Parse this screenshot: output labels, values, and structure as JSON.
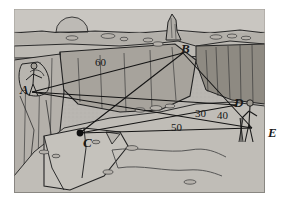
{
  "scene": {
    "kind": "illustration",
    "subject": "canyon-survey-diagram",
    "description": "Line drawing of a rocky canyon / quarry with two human figures and straight survey sight-lines connecting labelled stations",
    "background_color": "#ffffff",
    "terrain_color": "#b9b6b1",
    "terrain_shadow_color": "#9a968f",
    "terrain_dark_color": "#868279",
    "ink_color": "#1a1a1a",
    "frame": {
      "x": 14,
      "y": 9,
      "width": 251,
      "height": 184
    }
  },
  "labels": {
    "points": [
      {
        "id": "A",
        "text": "A",
        "x": 20,
        "y": 83,
        "note": "left rim, standing figure"
      },
      {
        "id": "B",
        "text": "B",
        "x": 181,
        "y": 42,
        "note": "far rim below rock spire"
      },
      {
        "id": "C",
        "text": "C",
        "x": 83,
        "y": 136,
        "note": "foreground ledge, marked with black dot"
      },
      {
        "id": "D",
        "text": "D",
        "x": 234,
        "y": 96,
        "note": "right rim near second figure"
      },
      {
        "id": "E",
        "text": "E",
        "x": 268,
        "y": 126,
        "note": "outside right edge of drawing"
      }
    ],
    "measurements": [
      {
        "text": "60",
        "x": 95,
        "y": 57,
        "note": "along line A-B"
      },
      {
        "text": "30",
        "x": 195,
        "y": 108,
        "note": "left of D"
      },
      {
        "text": "40",
        "x": 217,
        "y": 110,
        "note": "right of 30"
      },
      {
        "text": "50",
        "x": 171,
        "y": 122,
        "note": "along line C-E"
      }
    ]
  },
  "survey_lines": [
    {
      "from": "A",
      "to": "B",
      "label": "60"
    },
    {
      "from": "A",
      "to": "D",
      "label": ""
    },
    {
      "from": "A",
      "to": "E",
      "label": ""
    },
    {
      "from": "B",
      "to": "C",
      "label": ""
    },
    {
      "from": "B",
      "to": "E",
      "label": ""
    },
    {
      "from": "C",
      "to": "E",
      "label": "50"
    },
    {
      "from": "C",
      "to": "D",
      "label": ""
    }
  ],
  "figures": [
    {
      "name": "surveyor-left",
      "x": 24,
      "y": 62,
      "note": "person at station A on left cliff"
    },
    {
      "name": "surveyor-right",
      "x": 246,
      "y": 98,
      "note": "person with tripod near station D"
    }
  ],
  "features": [
    {
      "name": "sun-on-horizon",
      "x": 72,
      "y": 22
    },
    {
      "name": "rock-spire",
      "x": 172,
      "y": 18
    },
    {
      "name": "canyon-floor",
      "x": 150,
      "y": 165
    },
    {
      "name": "dry-stream-bed",
      "x": 170,
      "y": 160
    },
    {
      "name": "station-marker-dot",
      "x": 80,
      "y": 133
    }
  ]
}
